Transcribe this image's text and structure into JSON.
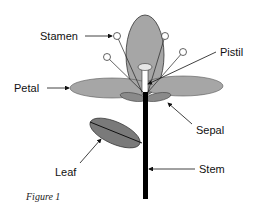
{
  "diagram": {
    "labels": {
      "stamen": "Stamen",
      "pistil": "Pistil",
      "petal": "Petal",
      "sepal": "Sepal",
      "leaf": "Leaf",
      "stem": "Stem"
    },
    "caption": "Figure 1",
    "colors": {
      "petal_fill": "#a6a6a6",
      "leaf_fill": "#7a7a7a",
      "stem": "#000000",
      "outline": "#333333",
      "anther_fill": "#ffffff"
    }
  }
}
